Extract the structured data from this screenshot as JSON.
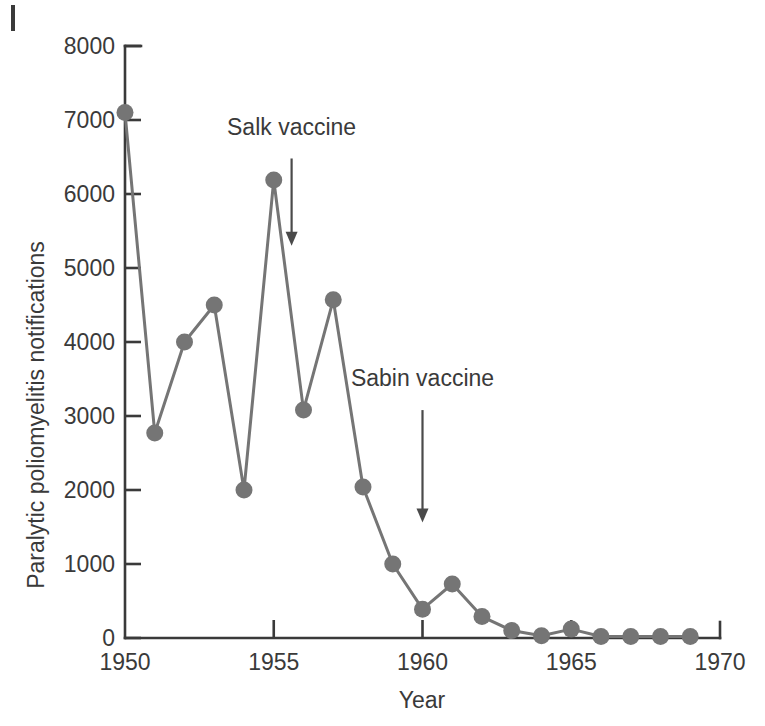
{
  "figure": {
    "corner_mark": "figure-corner-rule"
  },
  "chart_data": {
    "type": "line",
    "title": "",
    "xlabel": "Year",
    "ylabel": "Paralytic poliomyelitis notifications",
    "xlim": [
      1950,
      1970
    ],
    "ylim": [
      0,
      8000
    ],
    "grid": false,
    "legend": "none",
    "x": [
      1950,
      1951,
      1952,
      1953,
      1954,
      1955,
      1956,
      1957,
      1958,
      1959,
      1960,
      1961,
      1962,
      1963,
      1964,
      1965,
      1966,
      1967,
      1968,
      1969
    ],
    "values": [
      7100,
      2770,
      4000,
      4500,
      2000,
      6190,
      3080,
      4570,
      2040,
      1000,
      390,
      730,
      290,
      100,
      30,
      120,
      20,
      20,
      20,
      20
    ],
    "series": [
      {
        "name": "Paralytic poliomyelitis notifications",
        "color": "#757575",
        "marker": "circle",
        "values": [
          7100,
          2770,
          4000,
          4500,
          2000,
          6190,
          3080,
          4570,
          2040,
          1000,
          390,
          730,
          290,
          100,
          30,
          120,
          20,
          20,
          20,
          20
        ]
      }
    ],
    "xticks": [
      1950,
      1955,
      1960,
      1965,
      1970
    ],
    "xtick_labels": [
      "1950",
      "1955",
      "1960",
      "1965",
      "1970"
    ],
    "yticks": [
      0,
      1000,
      2000,
      3000,
      4000,
      5000,
      6000,
      7000,
      8000
    ],
    "ytick_labels": [
      "0",
      "1000",
      "2000",
      "3000",
      "4000",
      "5000",
      "6000",
      "7000",
      "8000"
    ],
    "annotations": [
      {
        "text": "Salk vaccine",
        "x": 1955.6,
        "y_text": 6800,
        "y_arrow_top": 6480,
        "y_arrow_tip": 5300
      },
      {
        "text": "Sabin vaccine",
        "x": 1960.0,
        "y_text": 3400,
        "y_arrow_top": 3080,
        "y_arrow_tip": 1560
      }
    ],
    "colors": {
      "line": "#757575",
      "marker": "#757575",
      "axis": "#3a3a3a",
      "text": "#3a3a3a",
      "background": "#ffffff"
    }
  }
}
